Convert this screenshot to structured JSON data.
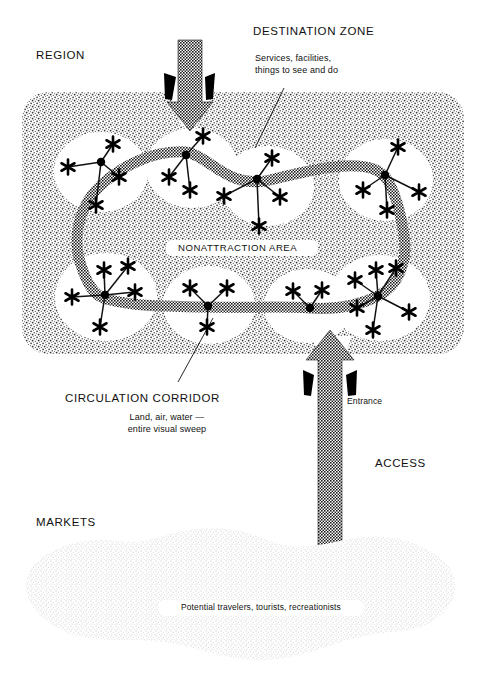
{
  "figure": {
    "type": "conceptual-diagram"
  },
  "labels": {
    "region": "REGION",
    "destination_zone": "DESTINATION ZONE",
    "destination_zone_note": "Services, facilities,\nthings to see and do",
    "nonattraction_area": "NONATTRACTION AREA",
    "circulation_corridor": "CIRCULATION CORRIDOR",
    "circulation_corridor_note": "Land, air, water —\nentire visual sweep",
    "entrance": "Entrance",
    "access": "ACCESS",
    "markets": "MARKETS",
    "markets_note": "Potential travelers, tourists, recreationists"
  },
  "colors": {
    "ink": "#111111",
    "paper": "#ffffff",
    "region_stipple": "#5a5a5a",
    "market_stipple": "#9a9a9a",
    "corridor": "#2b2b2b",
    "node": "#000000"
  },
  "icons": {
    "attraction": "asterisk-star-icon",
    "hub": "node-dot-icon",
    "arrow_in": "down-arrow-icon",
    "arrow_up": "up-arrow-icon",
    "gate": "entrance-bracket-icon"
  },
  "clusters": [
    {
      "name": "cluster-top-left",
      "hub": [
        101,
        162
      ],
      "stars": [
        [
          68,
          167
        ],
        [
          113,
          144
        ],
        [
          119,
          177
        ],
        [
          96,
          205
        ]
      ]
    },
    {
      "name": "cluster-top-center",
      "hub": [
        186,
        155
      ],
      "stars": [
        [
          203,
          136
        ],
        [
          169,
          177
        ],
        [
          190,
          190
        ]
      ]
    },
    {
      "name": "cluster-top-mid",
      "hub": [
        257,
        179
      ],
      "stars": [
        [
          224,
          196
        ],
        [
          272,
          158
        ],
        [
          280,
          197
        ],
        [
          259,
          226
        ]
      ]
    },
    {
      "name": "cluster-top-right",
      "hub": [
        385,
        175
      ],
      "stars": [
        [
          398,
          147
        ],
        [
          363,
          190
        ],
        [
          387,
          210
        ],
        [
          419,
          192
        ]
      ]
    },
    {
      "name": "cluster-bottom-left",
      "hub": [
        105,
        295
      ],
      "stars": [
        [
          72,
          297
        ],
        [
          104,
          270
        ],
        [
          128,
          266
        ],
        [
          135,
          292
        ],
        [
          100,
          327
        ]
      ]
    },
    {
      "name": "cluster-bottom-center",
      "hub": [
        208,
        306
      ],
      "stars": [
        [
          190,
          288
        ],
        [
          227,
          288
        ],
        [
          207,
          327
        ]
      ]
    },
    {
      "name": "cluster-bottom-mid",
      "hub": [
        310,
        308
      ],
      "stars": [
        [
          293,
          291
        ],
        [
          322,
          290
        ]
      ]
    },
    {
      "name": "cluster-bottom-right",
      "hub": [
        378,
        296
      ],
      "stars": [
        [
          355,
          280
        ],
        [
          357,
          308
        ],
        [
          376,
          270
        ],
        [
          396,
          268
        ],
        [
          409,
          312
        ],
        [
          373,
          330
        ]
      ]
    }
  ],
  "counts": {
    "destination_zones": 8,
    "entrances": 2
  }
}
